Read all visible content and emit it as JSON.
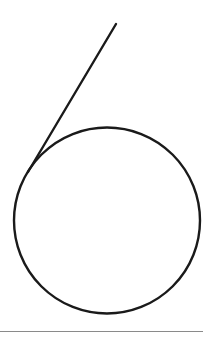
{
  "figure": {
    "stroke_color": "#1a1a1a",
    "divider_color": "#8a8a8a",
    "background": "#ffffff"
  }
}
